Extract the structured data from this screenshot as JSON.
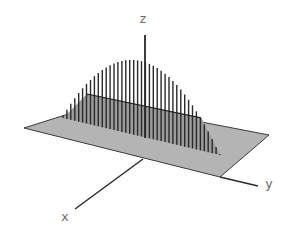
{
  "diagram": {
    "type": "3d-surface-illustration",
    "axes": {
      "x": {
        "label": "x",
        "from": [
          143,
          159
        ],
        "to": [
          75,
          209
        ],
        "label_pos": [
          61,
          210
        ]
      },
      "y": {
        "label": "y",
        "from": [
          220,
          177
        ],
        "to": [
          258,
          186
        ],
        "label_pos": [
          265,
          177
        ]
      },
      "z": {
        "label": "z",
        "from": [
          145,
          138
        ],
        "to": [
          145,
          35
        ],
        "label_pos": [
          139,
          12
        ]
      }
    },
    "plane": {
      "fill": "#b4b4b4",
      "stroke": "#3a3a3a",
      "corners": [
        [
          24,
          128
        ],
        [
          103,
          103
        ],
        [
          269,
          135
        ],
        [
          220,
          177
        ]
      ]
    },
    "shadow_triangle": {
      "fill": "#9c9c9c",
      "vertices": [
        [
          63,
          118
        ],
        [
          87,
          94
        ],
        [
          201,
          117
        ],
        [
          220,
          155
        ]
      ]
    },
    "back_edge": {
      "from": [
        87,
        94
      ],
      "to": [
        201,
        118
      ]
    },
    "stems": {
      "count": 41,
      "base_start": [
        63,
        118
      ],
      "base_end": [
        220,
        155
      ],
      "top_points": [
        [
          63,
          116
        ],
        [
          128,
          60
        ],
        [
          219,
          153
        ]
      ],
      "color": "#2a2a2a"
    },
    "colors": {
      "background": "#ffffff",
      "line": "#2a2a2a",
      "plane": "#b4b4b4",
      "label": "#6a6a6a"
    }
  }
}
